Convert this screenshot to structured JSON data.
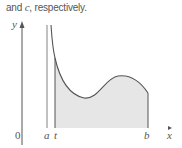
{
  "caption": {
    "prefix": "and ",
    "variable": "c",
    "suffix": ", respectively."
  },
  "diagram": {
    "axis_labels": {
      "y": "y",
      "x": "x",
      "origin": "0"
    },
    "markers": {
      "a": "a",
      "t": "t",
      "b": "b"
    },
    "colors": {
      "line": "#555555",
      "fill": "#e6e6e6",
      "text": "#555555"
    }
  }
}
